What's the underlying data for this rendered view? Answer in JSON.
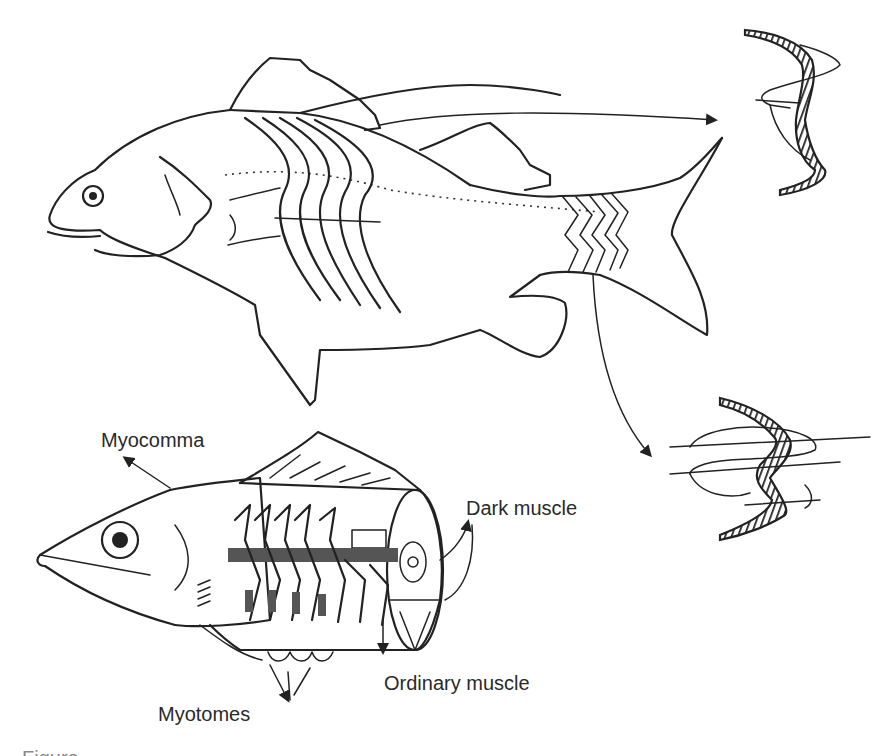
{
  "figure": {
    "type": "anatomical-diagram",
    "labels": {
      "myocomma": "Myocomma",
      "dark_muscle": "Dark muscle",
      "ordinary_muscle": "Ordinary muscle",
      "myotomes": "Myotomes"
    },
    "caption_partial": "Figure"
  },
  "colors": {
    "line": "#222222",
    "background": "#ffffff",
    "dark_muscle_fill": "#555555",
    "label_text": "#2a2a2a"
  }
}
